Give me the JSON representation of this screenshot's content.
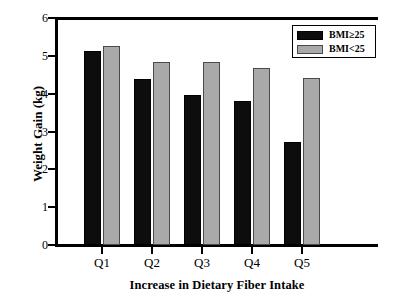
{
  "chart_data": {
    "type": "bar",
    "title": "",
    "xlabel": "Increase in Dietary Fiber Intake",
    "ylabel": "Weight Gain (kg)",
    "categories": [
      "Q1",
      "Q2",
      "Q3",
      "Q4",
      "Q5"
    ],
    "series": [
      {
        "name": "BMI≥25",
        "color": "#0d0d0d",
        "values": [
          5.13,
          4.39,
          3.97,
          3.81,
          2.72
        ]
      },
      {
        "name": "BMI<25",
        "color": "#a9a9a9",
        "values": [
          5.26,
          4.83,
          4.83,
          4.67,
          4.41
        ]
      }
    ],
    "ylim": [
      0,
      6
    ],
    "yticks": [
      0,
      1,
      2,
      3,
      4,
      5,
      6
    ],
    "ytick_labels": [
      "0",
      "1",
      "2",
      "3",
      "4",
      "5",
      "6"
    ],
    "grid": false,
    "legend_position": "upper right"
  },
  "legend": {
    "entries": [
      {
        "label": "BMI≥25",
        "swatch": "dark-swatch"
      },
      {
        "label": "BMI<25",
        "swatch": "light-swatch"
      }
    ]
  },
  "axes": {
    "y_axis_name": "y-axis",
    "x_axis_name": "x-axis"
  }
}
